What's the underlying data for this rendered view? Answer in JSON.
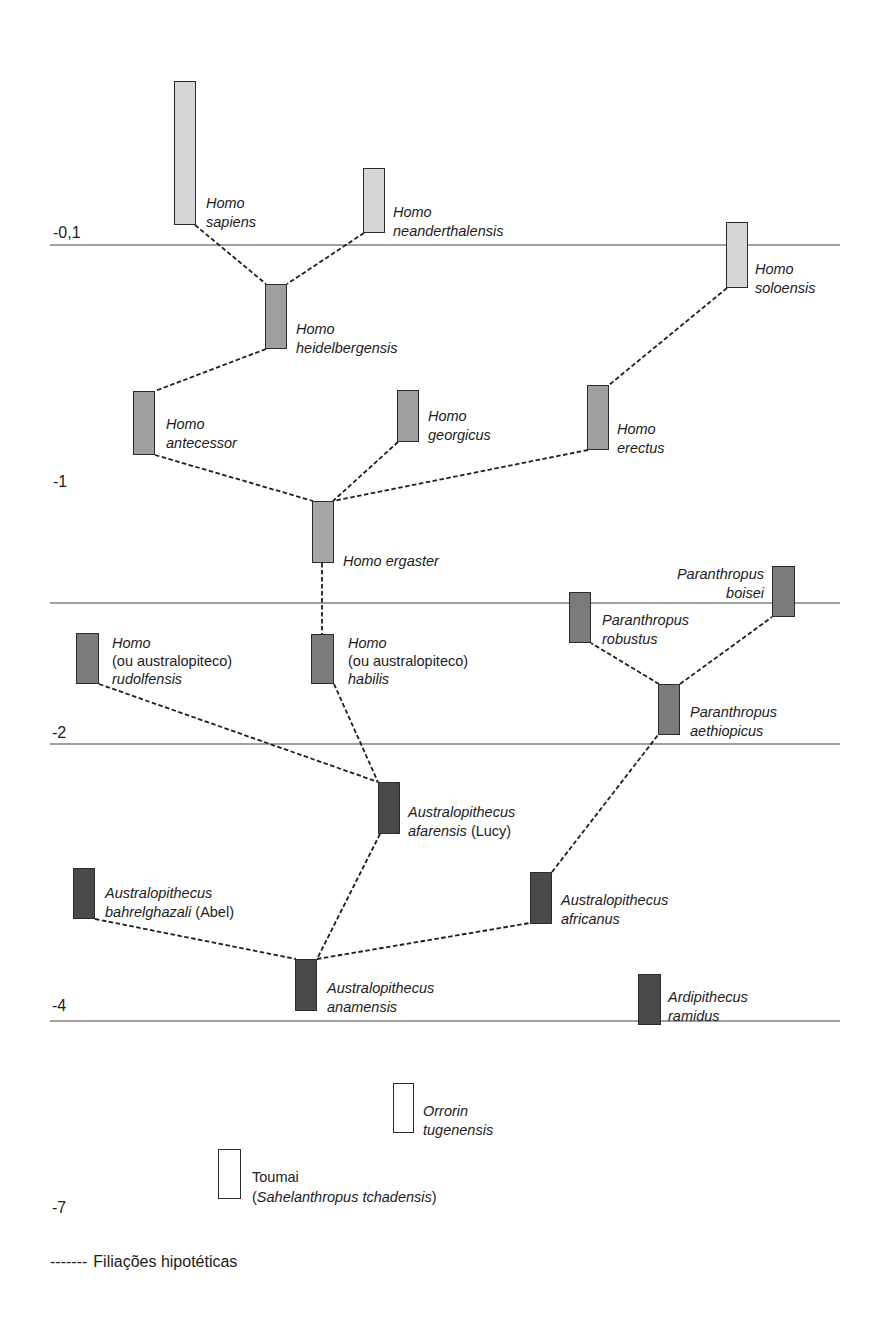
{
  "diagram": {
    "time_axis": {
      "labels": {
        "t0_1": "-0,1",
        "t1": "-1",
        "t2": "-2",
        "t4": "-4",
        "t7": "-7"
      }
    },
    "species": {
      "homo_sapiens": {
        "genus": "Homo",
        "species": "sapiens",
        "fill": "#d6d6d6"
      },
      "homo_neanderthalensis": {
        "genus": "Homo",
        "species": "neanderthalensis",
        "fill": "#d6d6d6"
      },
      "homo_soloensis": {
        "genus": "Homo",
        "species": "soloensis",
        "fill": "#d6d6d6"
      },
      "homo_heidelbergensis": {
        "genus": "Homo",
        "species": "heidelbergensis",
        "fill": "#a0a0a0"
      },
      "homo_antecessor": {
        "genus": "Homo",
        "species": "antecessor",
        "fill": "#a0a0a0"
      },
      "homo_georgicus": {
        "genus": "Homo",
        "species": "georgicus",
        "fill": "#a0a0a0"
      },
      "homo_erectus": {
        "genus": "Homo",
        "species": "erectus",
        "fill": "#a0a0a0"
      },
      "homo_ergaster": {
        "genus": "Homo",
        "species": "ergaster",
        "fill": "#a6a6a6"
      },
      "homo_rudolfensis": {
        "genus": "Homo",
        "note": "(ou australopiteco)",
        "species": "rudolfensis",
        "fill": "#7b7b7b"
      },
      "homo_habilis": {
        "genus": "Homo",
        "note": "(ou australopiteco)",
        "species": "habilis",
        "fill": "#7b7b7b"
      },
      "paranthropus_boisei": {
        "genus": "Paranthropus",
        "species": "boisei",
        "fill": "#7b7b7b"
      },
      "paranthropus_robustus": {
        "genus": "Paranthropus",
        "species": "robustus",
        "fill": "#7b7b7b"
      },
      "paranthropus_aethiopicus": {
        "genus": "Paranthropus",
        "species": "aethiopicus",
        "fill": "#7b7b7b"
      },
      "australopithecus_afarensis": {
        "genus": "Australopithecus",
        "species": "afarensis",
        "nickname": "(Lucy)",
        "fill": "#4a4a4a"
      },
      "australopithecus_bahrelghazali": {
        "genus": "Australopithecus",
        "species": "bahrelghazali",
        "nickname": "(Abel)",
        "fill": "#4a4a4a"
      },
      "australopithecus_anamensis": {
        "genus": "Australopithecus",
        "species": "anamensis",
        "fill": "#4a4a4a"
      },
      "australopithecus_africanus": {
        "genus": "Australopithecus",
        "species": "africanus",
        "fill": "#4a4a4a"
      },
      "ardipithecus_ramidus": {
        "genus": "Ardipithecus",
        "species": "ramidus",
        "fill": "#4a4a4a"
      },
      "orrorin_tugenensis": {
        "genus": "Orrorin",
        "species": "tugenensis",
        "fill": "#ffffff"
      },
      "toumai": {
        "common_name": "Toumai",
        "paren_open": "(",
        "genus": "Sahelanthropus",
        "species": "tchadensis",
        "paren_close": ")",
        "fill": "#ffffff"
      }
    },
    "filiations": [
      {
        "from": "homo_heidelbergensis",
        "to": "homo_sapiens"
      },
      {
        "from": "homo_heidelbergensis",
        "to": "homo_neanderthalensis"
      },
      {
        "from": "homo_antecessor",
        "to": "homo_heidelbergensis"
      },
      {
        "from": "homo_ergaster",
        "to": "homo_antecessor"
      },
      {
        "from": "homo_ergaster",
        "to": "homo_georgicus"
      },
      {
        "from": "homo_ergaster",
        "to": "homo_erectus"
      },
      {
        "from": "homo_erectus",
        "to": "homo_soloensis"
      },
      {
        "from": "homo_habilis",
        "to": "homo_ergaster"
      },
      {
        "from": "australopithecus_afarensis",
        "to": "homo_rudolfensis"
      },
      {
        "from": "australopithecus_afarensis",
        "to": "homo_habilis"
      },
      {
        "from": "australopithecus_anamensis",
        "to": "australopithecus_afarensis"
      },
      {
        "from": "australopithecus_anamensis",
        "to": "australopithecus_bahrelghazali"
      },
      {
        "from": "australopithecus_anamensis",
        "to": "australopithecus_africanus"
      },
      {
        "from": "australopithecus_africanus",
        "to": "paranthropus_aethiopicus"
      },
      {
        "from": "paranthropus_aethiopicus",
        "to": "paranthropus_robustus"
      },
      {
        "from": "paranthropus_aethiopicus",
        "to": "paranthropus_boisei"
      }
    ],
    "legend": {
      "dash_sample": "-------",
      "label": "Filiações hipotéticas"
    }
  },
  "colors": {
    "gridline": "#a0a0a0",
    "filiation_line": "#1e1e1e",
    "box_border": "#2b2b2b",
    "recent": "#d6d6d6",
    "homo": "#a0a0a0",
    "dark_medium": "#7b7b7b",
    "dark": "#4a4a4a",
    "empty": "#ffffff"
  }
}
